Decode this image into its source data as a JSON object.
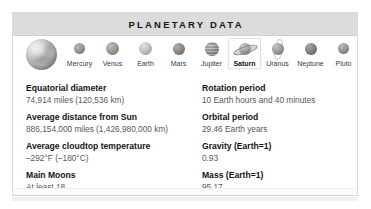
{
  "card": {
    "header": {
      "title": "PLANETARY DATA"
    },
    "hero": {
      "icon_name": "saturn-hero-image"
    },
    "planets": [
      {
        "label": "Mercury",
        "icon_name": "planet-mercury-icon",
        "selected": false
      },
      {
        "label": "Venus",
        "icon_name": "planet-venus-icon",
        "selected": false
      },
      {
        "label": "Earth",
        "icon_name": "planet-earth-icon",
        "selected": false
      },
      {
        "label": "Mars",
        "icon_name": "planet-mars-icon",
        "selected": false
      },
      {
        "label": "Jupiter",
        "icon_name": "planet-jupiter-icon",
        "selected": false
      },
      {
        "label": "Saturn",
        "icon_name": "planet-saturn-icon",
        "selected": true
      },
      {
        "label": "Uranus",
        "icon_name": "planet-uranus-icon",
        "selected": false
      },
      {
        "label": "Neptune",
        "icon_name": "planet-neptune-icon",
        "selected": false
      },
      {
        "label": "Pluto",
        "icon_name": "planet-pluto-icon",
        "selected": false
      }
    ],
    "columns": {
      "left": [
        {
          "label": "Equatorial diameter",
          "value": "74,914 miles (120,536 km)"
        },
        {
          "label": "Average distance from Sun",
          "value": "886,154,000 miles (1,426,980,000 km)"
        },
        {
          "label": "Average cloudtop temperature",
          "value": "–292°F (–180°C)"
        },
        {
          "label": "Main Moons",
          "value": "At least 18"
        }
      ],
      "right": [
        {
          "label": "Rotation period",
          "value": "10 Earth hours and 40 minutes"
        },
        {
          "label": "Orbital period",
          "value": "29.46 Earth years"
        },
        {
          "label": "Gravity (Earth=1)",
          "value": "0.93"
        },
        {
          "label": "Mass (Earth=1)",
          "value": "95.17"
        }
      ]
    }
  },
  "colors": {
    "header_band": "#dcdcdc",
    "card_border": "#d8d8d8",
    "label_text": "#131313",
    "value_text": "#575757",
    "selection_border": "#e2e2e2"
  }
}
